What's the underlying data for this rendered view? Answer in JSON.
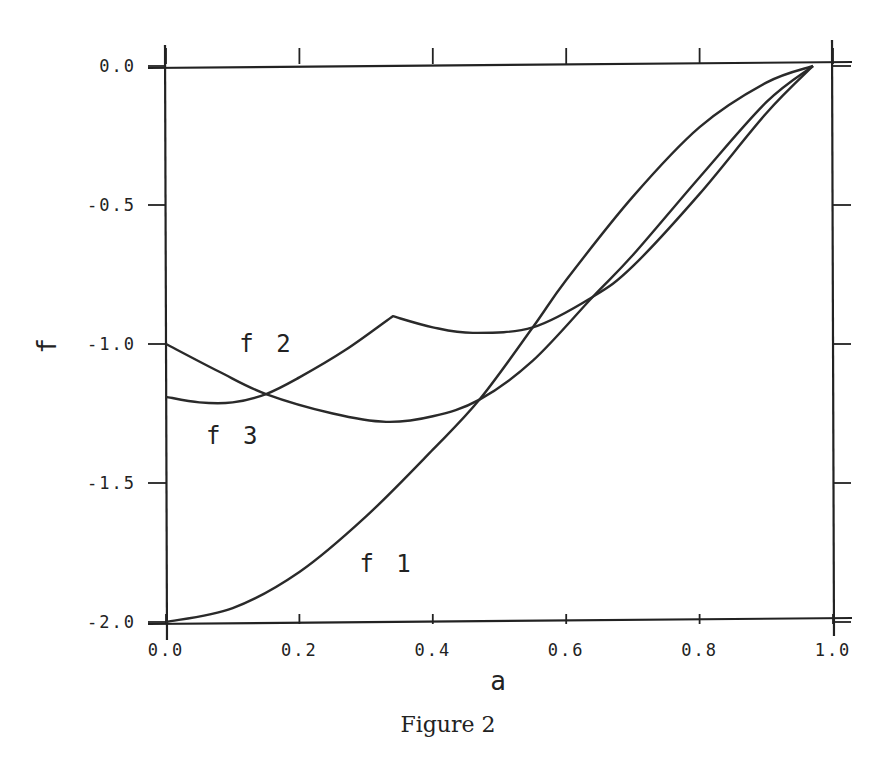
{
  "figure": {
    "caption": "Figure 2"
  },
  "chart_data": {
    "type": "line",
    "title": "",
    "xlabel": "a",
    "ylabel": "f",
    "xlim": [
      0.0,
      1.0
    ],
    "ylim": [
      -2.0,
      0.0
    ],
    "grid": false,
    "legend": "inline labels",
    "xticks": [
      "0.0",
      "0.2",
      "0.4",
      "0.6",
      "0.8",
      "1.0"
    ],
    "yticks": [
      "0.0",
      "-0.5",
      "-1.0",
      "-1.5",
      "-2.0"
    ],
    "series": [
      {
        "name": "f1",
        "x": [
          0.0,
          0.1,
          0.2,
          0.3,
          0.4,
          0.47,
          0.55,
          0.6,
          0.7,
          0.8,
          0.9,
          0.97
        ],
        "values": [
          -2.0,
          -1.95,
          -1.82,
          -1.62,
          -1.38,
          -1.2,
          -0.94,
          -0.77,
          -0.47,
          -0.22,
          -0.06,
          0.0
        ]
      },
      {
        "name": "f2",
        "x": [
          0.0,
          0.08,
          0.15,
          0.25,
          0.33,
          0.4,
          0.47,
          0.55,
          0.64,
          0.7,
          0.8,
          0.9,
          0.97
        ],
        "values": [
          -1.0,
          -1.1,
          -1.18,
          -1.25,
          -1.28,
          -1.26,
          -1.2,
          -1.06,
          -0.83,
          -0.68,
          -0.4,
          -0.13,
          0.0
        ]
      },
      {
        "name": "f3",
        "x": [
          0.0,
          0.05,
          0.1,
          0.15,
          0.2,
          0.27,
          0.34,
          0.4,
          0.46,
          0.55,
          0.64,
          0.7,
          0.8,
          0.9,
          0.97
        ],
        "values": [
          -1.19,
          -1.21,
          -1.21,
          -1.18,
          -1.12,
          -1.02,
          -0.9,
          -0.94,
          -0.96,
          -0.94,
          -0.83,
          -0.72,
          -0.46,
          -0.17,
          0.0
        ]
      }
    ],
    "annotations": [
      {
        "text": "f2",
        "x": 0.11,
        "y": -1.0
      },
      {
        "text": "f3",
        "x": 0.06,
        "y": -1.33
      },
      {
        "text": "f1",
        "x": 0.29,
        "y": -1.79
      }
    ]
  }
}
